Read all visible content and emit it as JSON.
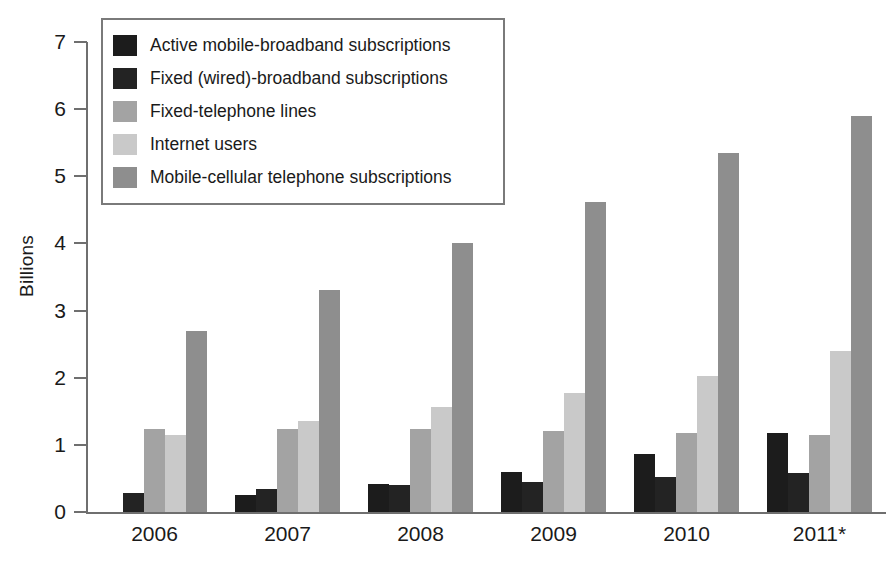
{
  "chart_data": {
    "type": "bar",
    "title": "",
    "subtitle": "",
    "xlabel": "",
    "ylabel": "Billions",
    "categories": [
      "2006",
      "2007",
      "2008",
      "2009",
      "2010",
      "2011*"
    ],
    "ylim": [
      0,
      7
    ],
    "yticks": [
      0,
      1,
      2,
      3,
      4,
      5,
      6,
      7
    ],
    "ytick_labels": [
      "0",
      "1",
      "2",
      "3",
      "4",
      "5",
      "6",
      "7"
    ],
    "grid": false,
    "legend_position": "top-left",
    "series": [
      {
        "name": "Active mobile-broadband subscriptions",
        "color": "#1c1c1c",
        "values": [
          0.0,
          0.26,
          0.41,
          0.6,
          0.86,
          1.18
        ]
      },
      {
        "name": "Fixed (wired)-broadband subscriptions",
        "color": "#232323",
        "values": [
          0.28,
          0.34,
          0.4,
          0.45,
          0.52,
          0.58
        ]
      },
      {
        "name": "Fixed-telephone lines",
        "color": "#a3a3a3",
        "values": [
          1.24,
          1.24,
          1.24,
          1.21,
          1.18,
          1.15
        ]
      },
      {
        "name": "Internet users",
        "color": "#c9c9c9",
        "values": [
          1.15,
          1.35,
          1.57,
          1.78,
          2.03,
          2.4
        ]
      },
      {
        "name": "Mobile-cellular telephone subscriptions",
        "color": "#8e8e8e",
        "values": [
          2.69,
          3.31,
          4.0,
          4.62,
          5.35,
          5.9
        ]
      }
    ]
  },
  "axis": {
    "y_title": "Billions"
  },
  "colors": {
    "axis_line": "#6f6f6f",
    "legend_border": "#7a7a7a",
    "text": "#1a1a1a",
    "background": "#ffffff"
  }
}
